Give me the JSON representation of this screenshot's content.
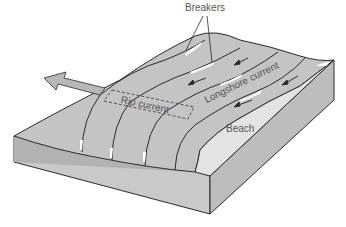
{
  "figure": {
    "labels": {
      "breakers": "Breakers",
      "rip_current": "Rip current",
      "longshore_current": "Longshore current",
      "beach": "Beach"
    }
  },
  "colors": {
    "background": "#ffffff",
    "water_surface": "#c4c4c4",
    "water_dark": "#b2b2b2",
    "beach": "#e3e3e3",
    "block_front": "#c9c9c9",
    "block_right": "#bdbdbd",
    "outline": "#2b2b2b",
    "foam": "#ffffff",
    "label_text": "#555555",
    "arrow_fill": "#b8b8b8"
  },
  "icons": {
    "offshore_arrow": "arrow-left-icon",
    "current_arrows": "arrow-down-left-icon"
  }
}
